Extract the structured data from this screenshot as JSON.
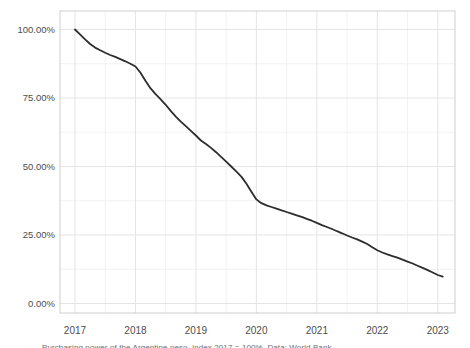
{
  "colors": {
    "line": "#2d2d2d",
    "grid_major": "#e4e4e4",
    "grid_minor": "#f2f2f2",
    "panel_border": "#cfcfcf",
    "axis_text": "#4d4d4d",
    "background": "#ffffff"
  },
  "caption": "Purchasing power of the Argentine peso, index 2017 = 100%. Data: World Bank",
  "chart_data": {
    "type": "line",
    "title": "",
    "xlabel": "",
    "ylabel": "",
    "legend": null,
    "grid": "on",
    "xlim": [
      2016.752,
      2023.285
    ],
    "ylim": [
      -3.47,
      106.75
    ],
    "x_tick_values": [
      2017,
      2018,
      2019,
      2020,
      2021,
      2022,
      2023
    ],
    "x_tick_labels": [
      "2017",
      "2018",
      "2019",
      "2020",
      "2021",
      "2022",
      "2023"
    ],
    "y_tick_values": [
      0,
      25,
      50,
      75,
      100
    ],
    "y_tick_labels": [
      "0.00%",
      "25.00%",
      "50.00%",
      "75.00%",
      "100.00%"
    ],
    "x_minor_ticks": [
      2017.5,
      2018.5,
      2019.5,
      2020.5,
      2021.5,
      2022.5
    ],
    "y_minor_ticks": [
      12.5,
      37.5,
      62.5,
      87.5
    ],
    "series": [
      {
        "name": "index",
        "x": [
          2017.0,
          2017.083,
          2017.167,
          2017.25,
          2017.333,
          2017.417,
          2017.5,
          2017.583,
          2017.667,
          2017.75,
          2017.833,
          2017.917,
          2018.0,
          2018.083,
          2018.167,
          2018.25,
          2018.333,
          2018.417,
          2018.5,
          2018.583,
          2018.667,
          2018.75,
          2018.833,
          2018.917,
          2019.0,
          2019.083,
          2019.167,
          2019.25,
          2019.333,
          2019.417,
          2019.5,
          2019.583,
          2019.667,
          2019.75,
          2019.833,
          2019.917,
          2020.0,
          2020.083,
          2020.167,
          2020.25,
          2020.333,
          2020.417,
          2020.5,
          2020.583,
          2020.667,
          2020.75,
          2020.833,
          2020.917,
          2021.0,
          2021.083,
          2021.167,
          2021.25,
          2021.333,
          2021.417,
          2021.5,
          2021.583,
          2021.667,
          2021.75,
          2021.833,
          2021.917,
          2022.0,
          2022.083,
          2022.167,
          2022.25,
          2022.333,
          2022.417,
          2022.5,
          2022.583,
          2022.667,
          2022.75,
          2022.833,
          2022.917,
          2023.0,
          2023.083
        ],
        "y": [
          100.0,
          98.2,
          96.4,
          94.7,
          93.4,
          92.4,
          91.5,
          90.7,
          90.0,
          89.2,
          88.4,
          87.5,
          86.5,
          84.2,
          81.2,
          78.5,
          76.4,
          74.5,
          72.5,
          70.3,
          68.2,
          66.4,
          64.7,
          63.0,
          61.3,
          59.5,
          58.2,
          56.8,
          55.2,
          53.5,
          51.8,
          50.0,
          48.2,
          46.3,
          43.8,
          40.8,
          38.0,
          36.6,
          35.8,
          35.2,
          34.6,
          34.0,
          33.4,
          32.8,
          32.2,
          31.6,
          30.9,
          30.2,
          29.4,
          28.6,
          27.9,
          27.2,
          26.4,
          25.6,
          24.8,
          24.1,
          23.4,
          22.6,
          21.7,
          20.5,
          19.4,
          18.6,
          17.9,
          17.3,
          16.7,
          16.0,
          15.3,
          14.6,
          13.8,
          13.0,
          12.2,
          11.3,
          10.4,
          9.8
        ]
      }
    ]
  }
}
